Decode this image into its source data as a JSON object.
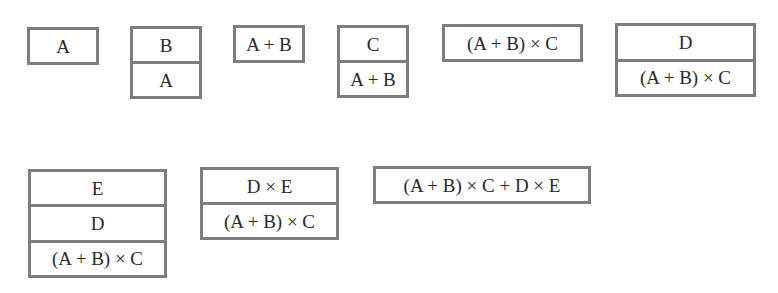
{
  "diagram": {
    "title": "",
    "stacks": [
      {
        "id": "s1",
        "cells": [
          "A"
        ]
      },
      {
        "id": "s2",
        "cells": [
          "B",
          "A"
        ]
      },
      {
        "id": "s3",
        "cells": [
          "A + B"
        ]
      },
      {
        "id": "s4",
        "cells": [
          "C",
          "A + B"
        ]
      },
      {
        "id": "s5",
        "cells": [
          "(A + B) × C"
        ]
      },
      {
        "id": "s6",
        "cells": [
          "D",
          "(A + B) × C"
        ]
      },
      {
        "id": "s7",
        "cells": [
          "E",
          "D",
          "(A + B) × C"
        ]
      },
      {
        "id": "s8",
        "cells": [
          "D × E",
          "(A + B) × C"
        ]
      },
      {
        "id": "s9",
        "cells": [
          "(A + B) × C + D × E"
        ]
      }
    ]
  },
  "colors": {
    "border": "#7e7e7e",
    "text": "#2a2a2a",
    "background": "#ffffff"
  }
}
